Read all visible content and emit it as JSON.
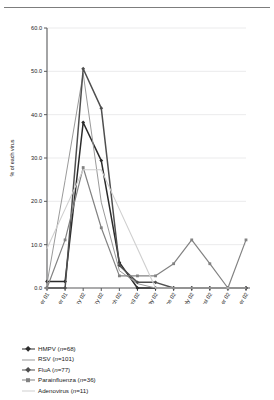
{
  "chart_data": {
    "type": "line",
    "title": "",
    "xlabel": "",
    "ylabel": "% of each virus",
    "ylim": [
      0,
      60
    ],
    "yticks": [
      0.0,
      10.0,
      20.0,
      30.0,
      40.0,
      50.0,
      60.0
    ],
    "ytick_labels": [
      "0.0",
      "10.0",
      "20.0",
      "30.0",
      "40.0",
      "50.0",
      "60.0"
    ],
    "grid": true,
    "legend_position": "below",
    "categories": [
      "November 01",
      "December 01",
      "January 02",
      "February 02",
      "March 02",
      "April 02",
      "May 02",
      "June 02",
      "July 02",
      "August 02",
      "September 02",
      "October 02"
    ],
    "series": [
      {
        "name": "HMPV",
        "n": 68,
        "legend_label": "HMPV (n=68)",
        "color": "#2b2b2b",
        "width": 1.5,
        "marker": "diamond",
        "values": [
          1.5,
          1.5,
          38.2,
          29.4,
          5.9,
          0.0,
          0.0,
          0.0,
          0.0,
          0.0,
          0.0,
          0.0
        ]
      },
      {
        "name": "RSV",
        "n": 101,
        "legend_label": "RSV (n=101)",
        "color": "#9a9a9a",
        "width": 1.0,
        "marker": "none",
        "values": [
          1.0,
          24.8,
          49.5,
          19.8,
          4.0,
          1.0,
          0.0,
          0.0,
          0.0,
          0.0,
          0.0,
          0.0
        ]
      },
      {
        "name": "FluA",
        "n": 77,
        "legend_label": "FluA (n=77)",
        "color": "#4f4f4f",
        "width": 1.5,
        "marker": "diamond",
        "values": [
          0.0,
          0.0,
          50.6,
          41.5,
          5.2,
          1.3,
          1.3,
          0.0,
          0.0,
          0.0,
          0.0,
          0.0
        ]
      },
      {
        "name": "Parainfluenza",
        "n": 36,
        "legend_label": "Parainfluenza (n=36)",
        "color": "#828282",
        "width": 1.2,
        "marker": "square",
        "values": [
          0.0,
          11.1,
          27.8,
          13.9,
          2.8,
          2.8,
          2.8,
          5.6,
          11.1,
          5.6,
          0.0,
          11.1
        ]
      },
      {
        "name": "Adenovirus",
        "n": 11,
        "legend_label": "Adenovirus (n=11)",
        "color": "#cfcfcf",
        "width": 1.1,
        "marker": "none",
        "values": [
          9.1,
          18.2,
          27.3,
          27.3,
          18.2,
          9.1,
          0.0,
          0.0,
          0.0,
          0.0,
          0.0,
          0.0
        ]
      }
    ]
  },
  "legend": {
    "items": [
      {
        "label": "HMPV (n=68)"
      },
      {
        "label": "RSV (n=101)"
      },
      {
        "label": "FluA (n=77)"
      },
      {
        "label": "Parainfluenza (n=36)"
      },
      {
        "label": "Adenovirus (n=11)"
      }
    ]
  }
}
